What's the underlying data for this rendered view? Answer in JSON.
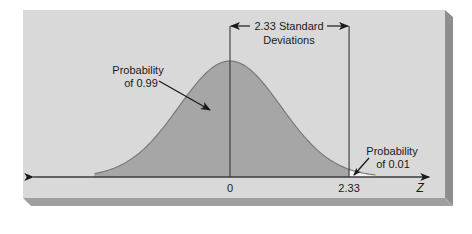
{
  "chart_data": {
    "type": "area",
    "title": "",
    "distribution": "standard normal",
    "xlabel": "Z",
    "ylabel": "",
    "x_range": [
      -3.85,
      3.9
    ],
    "curve_range": [
      -2.65,
      2.85
    ],
    "mean": 0,
    "sd": 1,
    "critical_value": 2.33,
    "x_ticks": [
      {
        "value": 0,
        "label": "0"
      },
      {
        "value": 2.33,
        "label": "2.33"
      }
    ],
    "regions": [
      {
        "name": "left-region",
        "from": -2.65,
        "to": 2.33,
        "probability": 0.99,
        "fill": "#a6a6a6"
      },
      {
        "name": "right-tail",
        "from": 2.33,
        "to": 2.85,
        "probability": 0.01,
        "fill": "#f2f2f2"
      }
    ],
    "annotations": {
      "span_label_line1": "2.33 Standard",
      "span_label_line2": "Deviations",
      "left_prob_line1": "Probability",
      "left_prob_line2": "of 0.99",
      "right_prob_line1": "Probability",
      "right_prob_line2": "of 0.01"
    },
    "grid": false,
    "legend": "none"
  },
  "colors": {
    "panel": "#d9d9d9",
    "panel_shadow_right": "#8e8e8e",
    "panel_shadow_bottom": "#9f9f9f",
    "curve": "#7a7a7a",
    "axis": "#3a3a3a"
  }
}
